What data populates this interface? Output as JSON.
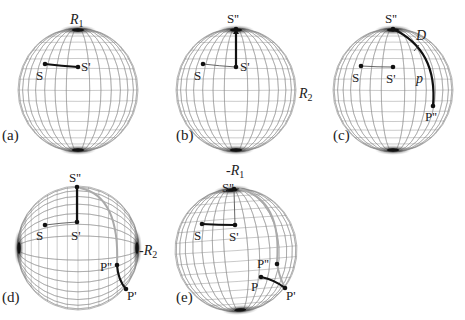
{
  "figure": {
    "panels": [
      {
        "id": "a",
        "label": "(a)",
        "label_pos": [
          2,
          140
        ],
        "sphere": {
          "cx": 78,
          "cy": 90,
          "rx": 60,
          "ry": 62,
          "orientation": "vertical",
          "tilt": 0
        },
        "axis_labels": [
          {
            "text": "R",
            "sub": "1",
            "x": 70,
            "y": 24
          }
        ],
        "points": [
          {
            "name": "S",
            "x": 45,
            "y": 64,
            "label": "S",
            "lx": 36,
            "ly": 80
          },
          {
            "name": "S-prime",
            "x": 78,
            "y": 67,
            "label": "S'",
            "lx": 81,
            "ly": 71
          }
        ],
        "paths": [
          {
            "style": "thick",
            "d": "M45,64 Q62,66 78,67"
          }
        ]
      },
      {
        "id": "b",
        "label": "(b)",
        "label_pos": [
          176,
          140
        ],
        "sphere": {
          "cx": 236,
          "cy": 90,
          "rx": 60,
          "ry": 62,
          "orientation": "vertical",
          "tilt": 0
        },
        "axis_labels": [
          {
            "text": "R",
            "sub": "2",
            "x": 299,
            "y": 98
          }
        ],
        "points": [
          {
            "name": "S",
            "x": 203,
            "y": 64,
            "label": "S",
            "lx": 194,
            "ly": 80
          },
          {
            "name": "S-prime",
            "x": 236,
            "y": 67,
            "label": "S'",
            "lx": 240,
            "ly": 71
          },
          {
            "name": "S-double-prime",
            "x": 236,
            "y": 29,
            "label": "S''",
            "lx": 227,
            "ly": 23
          }
        ],
        "paths": [
          {
            "style": "thin",
            "d": "M203,64 Q220,66 236,67"
          },
          {
            "style": "thick",
            "d": "M236,67 L236,30"
          }
        ],
        "arrows": [
          {
            "x": 236,
            "y": 29
          }
        ]
      },
      {
        "id": "c",
        "label": "(c)",
        "label_pos": [
          333,
          140
        ],
        "sphere": {
          "cx": 393,
          "cy": 90,
          "rx": 60,
          "ry": 62,
          "orientation": "vertical",
          "tilt": 0
        },
        "axis_labels": [
          {
            "text": "D",
            "sub": "",
            "x": 416,
            "y": 40
          },
          {
            "text": "p",
            "sub": "",
            "x": 416,
            "y": 83
          }
        ],
        "points": [
          {
            "name": "S",
            "x": 361,
            "y": 66,
            "label": "S",
            "lx": 352,
            "ly": 82
          },
          {
            "name": "S-prime",
            "x": 393,
            "y": 67,
            "label": "S'",
            "lx": 386,
            "ly": 83
          },
          {
            "name": "S-double-prime",
            "x": 393,
            "y": 29,
            "label": "S''",
            "lx": 385,
            "ly": 23
          },
          {
            "name": "P-double-prime",
            "x": 433,
            "y": 106,
            "label": "P''",
            "lx": 425,
            "ly": 121
          }
        ],
        "paths": [
          {
            "style": "thin",
            "d": "M361,66 Q377,67 393,67"
          },
          {
            "style": "thick",
            "d": "M393,29 Q438,50 433,106"
          }
        ],
        "ticks": [
          {
            "x1": 419,
            "y1": 45,
            "x2": 414,
            "y2": 51
          }
        ]
      },
      {
        "id": "d",
        "label": "(d)",
        "label_pos": [
          2,
          302
        ],
        "sphere": {
          "cx": 78,
          "cy": 248,
          "rx": 61,
          "ry": 62,
          "orientation": "horizontal",
          "tilt": 0
        },
        "axis_labels": [
          {
            "text": "-R",
            "sub": "2",
            "x": 139,
            "y": 255
          }
        ],
        "points": [
          {
            "name": "S",
            "x": 45,
            "y": 225,
            "label": "S",
            "lx": 36,
            "ly": 240
          },
          {
            "name": "S-prime",
            "x": 77,
            "y": 222,
            "label": "S'",
            "lx": 71,
            "ly": 240
          },
          {
            "name": "S-double-prime",
            "x": 77,
            "y": 187,
            "label": "S''",
            "lx": 69,
            "ly": 182
          },
          {
            "name": "P-double-prime",
            "x": 117,
            "y": 265,
            "label": "P''",
            "lx": 100,
            "ly": 271
          },
          {
            "name": "P-prime",
            "x": 126,
            "y": 289,
            "label": "P'",
            "lx": 127,
            "ly": 300
          }
        ],
        "paths": [
          {
            "style": "thin",
            "d": "M45,225 Q61,223 77,222"
          },
          {
            "style": "ghost",
            "d": "M80,188 Q120,196 117,265"
          },
          {
            "style": "thick",
            "d": "M77,222 L77,187"
          },
          {
            "style": "thick",
            "d": "M117,265 Q118,280 126,289"
          }
        ]
      },
      {
        "id": "e",
        "label": "(e)",
        "label_pos": [
          176,
          302
        ],
        "sphere": {
          "cx": 236,
          "cy": 250,
          "rx": 61,
          "ry": 62,
          "orientation": "vertical",
          "tilt": -4
        },
        "axis_labels": [
          {
            "text": "-R",
            "sub": "1",
            "x": 226,
            "y": 175
          }
        ],
        "points": [
          {
            "name": "S",
            "x": 202,
            "y": 224,
            "label": "S",
            "lx": 194,
            "ly": 240
          },
          {
            "name": "S-prime",
            "x": 235,
            "y": 225,
            "label": "S'",
            "lx": 229,
            "ly": 241
          },
          {
            "name": "S-double-prime",
            "x": 234,
            "y": 189,
            "label": "S''",
            "lx": 222,
            "ly": 192
          },
          {
            "name": "P-double-prime",
            "x": 277,
            "y": 264,
            "label": "P''",
            "lx": 257,
            "ly": 268
          },
          {
            "name": "P",
            "x": 261,
            "y": 277,
            "label": "P",
            "lx": 251,
            "ly": 291
          },
          {
            "name": "P-prime",
            "x": 285,
            "y": 288,
            "label": "P'",
            "lx": 286,
            "ly": 300
          }
        ],
        "paths": [
          {
            "style": "ghost",
            "d": "M240,189 Q282,200 277,262 Q278,274 285,288"
          },
          {
            "style": "thin",
            "d": "M234,190 L235,225"
          },
          {
            "style": "thick",
            "d": "M202,224 Q218,225 235,225"
          },
          {
            "style": "thick",
            "d": "M261,277 Q275,280 285,288"
          }
        ]
      }
    ]
  }
}
